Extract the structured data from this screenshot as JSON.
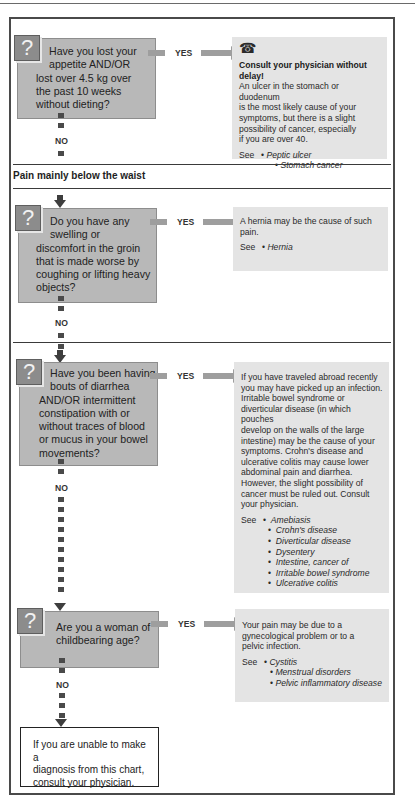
{
  "sections": {
    "below_waist_heading": "Pain mainly below the waist"
  },
  "labels": {
    "yes": "YES",
    "no": "NO",
    "see": "See",
    "question_icon": "?",
    "phone_icon": "☎"
  },
  "questions": [
    {
      "lines": [
        "Have you lost your",
        "appetite AND/OR",
        "lost over 4.5 kg over",
        "the past 10 weeks",
        "without dieting?"
      ]
    },
    {
      "lines": [
        "Do you have any",
        "swelling or",
        "discomfort in the groin",
        "that is made worse by",
        "coughing or lifting heavy",
        "objects?"
      ]
    },
    {
      "lines": [
        "Have you been having",
        "bouts of diarrhea",
        "AND/OR intermittent",
        "constipation with or",
        "without traces of blood",
        "or mucus in your bowel",
        "movements?"
      ]
    },
    {
      "lines": [
        "Are you a woman of",
        "childbearing age?"
      ]
    }
  ],
  "answers": [
    {
      "urgent": true,
      "headline": "Consult your physician without delay!",
      "lines": [
        "An ulcer in the stomach or duodenum",
        "is the most likely cause of your",
        "symptoms, but there is a slight",
        "possibility of cancer, especially",
        "if you are over 40."
      ],
      "see": [
        "Peptic ulcer",
        "Stomach cancer"
      ]
    },
    {
      "lines": [
        "A hernia may be the cause of such",
        "pain."
      ],
      "see": [
        "Hernia"
      ]
    },
    {
      "lines": [
        "If you have traveled abroad recently",
        "you may have picked up an infection.",
        "Irritable bowel syndrome or",
        "diverticular disease (in which pouches",
        "develop on the walls of the large",
        "intestine) may be the cause of your",
        "symptoms. Crohn's disease and",
        "ulcerative colitis may cause lower",
        "abdominal pain and diarrhea.",
        "However, the slight possibility of",
        "cancer must be ruled out. Consult",
        "your physician."
      ],
      "see": [
        "Amebiasis",
        "Crohn's disease",
        "Diverticular disease",
        "Dysentery",
        "Intestine, cancer of",
        "Irritable bowel syndrome",
        "Ulcerative colitis"
      ]
    },
    {
      "lines": [
        "Your pain may be due to a",
        "gynecological problem or to a",
        "pelvic infection."
      ],
      "see": [
        "Cystitis",
        "Menstrual disorders",
        "Pelvic inflammatory disease"
      ]
    }
  ],
  "final": {
    "lines": [
      "If you are unable to make a",
      "diagnosis from this chart,",
      "consult your physician."
    ]
  },
  "colors": {
    "question_bg": "#b8b8b8",
    "question_icon_bg": "#8c8c8c",
    "answer_bg": "#e4e4e4",
    "arrow": "#9e9e9e",
    "frame": "#4a4a4a"
  }
}
